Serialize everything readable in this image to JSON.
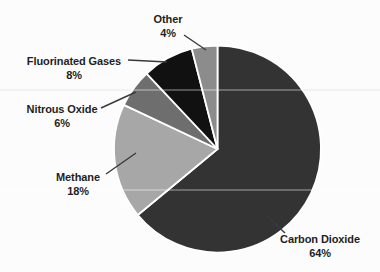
{
  "chart_data": {
    "type": "pie",
    "title": "",
    "categories": [
      "Carbon Dioxide",
      "Methane",
      "Nitrous Oxide",
      "Fluorinated Gases",
      "Other"
    ],
    "values": [
      64,
      18,
      6,
      8,
      4
    ],
    "colors": [
      "#333333",
      "#a7a7a7",
      "#6e6e6e",
      "#111111",
      "#8c8c8c"
    ],
    "start_angle_deg": 0,
    "direction": "clockwise",
    "separator_color": "#ffffff",
    "label_format": "{name} {value}%",
    "legend": "none",
    "background": "#fcfcfc",
    "label_color": "#1f1f1f",
    "leader_line_color": "#3a3a3a"
  }
}
